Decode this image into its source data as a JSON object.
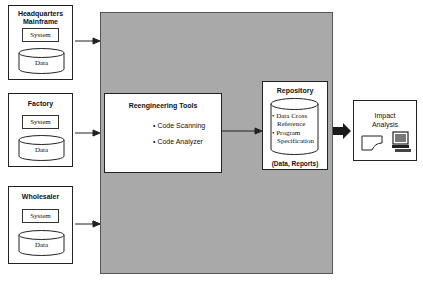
{
  "sources": [
    {
      "title_line1": "Headquarters",
      "title_line2": "Mainframe",
      "system_label": "System",
      "data_label": "Data"
    },
    {
      "title_line1": "Factory",
      "title_line2": "",
      "system_label": "System",
      "data_label": "Data"
    },
    {
      "title_line1": "Wholesaler",
      "title_line2": "",
      "system_label": "System",
      "data_label": "Data"
    }
  ],
  "tools": {
    "title": "Reengineering Tools",
    "items": [
      "• Code Scanning",
      "• Code Analyzer"
    ]
  },
  "repository": {
    "title": "Repository",
    "items": [
      "• Data Cross",
      "Reference",
      "• Program",
      "Specification"
    ],
    "footer": "(Data, Reports)"
  },
  "impact": {
    "title_line1": "Impact",
    "title_line2": "Analysis",
    "icons": [
      "document-icon",
      "computer-icon"
    ]
  },
  "colors": {
    "panel": "#a9a9a9",
    "stroke": "#222222"
  }
}
